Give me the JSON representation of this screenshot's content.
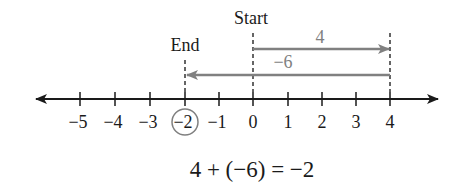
{
  "diagram": {
    "start_label": "Start",
    "end_label": "End",
    "move1_label": "4",
    "move2_label": "−6",
    "equation": "4 + (−6) = −2",
    "ticks": [
      "−5",
      "−4",
      "−3",
      "−2",
      "−1",
      "0",
      "1",
      "2",
      "3",
      "4"
    ],
    "circled_tick": "−2",
    "colors": {
      "axis": "#1a1a1a",
      "arrow": "#808080",
      "circle": "#808080"
    }
  }
}
